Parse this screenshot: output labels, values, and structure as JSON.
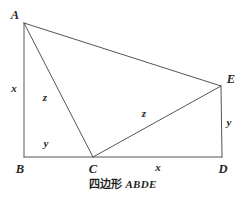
{
  "figure": {
    "caption_cn": "四边形",
    "caption_en": "ABDE",
    "stroke_color": "#555555",
    "text_color": "#262626",
    "background_color": "#ffffff",
    "vertices": [
      {
        "name": "A",
        "label": "A",
        "x": 24,
        "y": 23,
        "label_x": 15,
        "label_y": 15
      },
      {
        "name": "B",
        "label": "B",
        "x": 24,
        "y": 157,
        "label_x": 20,
        "label_y": 169
      },
      {
        "name": "C",
        "label": "C",
        "x": 93,
        "y": 157,
        "label_x": 93,
        "label_y": 169
      },
      {
        "name": "D",
        "label": "D",
        "x": 222,
        "y": 157,
        "label_x": 223,
        "label_y": 169
      },
      {
        "name": "E",
        "label": "E",
        "x": 221,
        "y": 86,
        "label_x": 231,
        "label_y": 79
      }
    ],
    "edges": [
      {
        "name": "segment-A-B",
        "from": "A",
        "to": "B"
      },
      {
        "name": "segment-B-D",
        "from": "B",
        "to": "D"
      },
      {
        "name": "segment-D-E",
        "from": "D",
        "to": "E"
      },
      {
        "name": "segment-E-A",
        "from": "E",
        "to": "A"
      },
      {
        "name": "segment-A-C",
        "from": "A",
        "to": "C"
      },
      {
        "name": "segment-C-E",
        "from": "C",
        "to": "E"
      }
    ],
    "side_labels": [
      {
        "name": "length-label-AB",
        "text": "x",
        "x": 14,
        "y": 88
      },
      {
        "name": "length-label-AC",
        "text": "z",
        "x": 45,
        "y": 97
      },
      {
        "name": "length-label-BC",
        "text": "y",
        "x": 46,
        "y": 143
      },
      {
        "name": "length-label-CE",
        "text": "z",
        "x": 144,
        "y": 113
      },
      {
        "name": "length-label-CD",
        "text": "x",
        "x": 158,
        "y": 167
      },
      {
        "name": "length-label-DE",
        "text": "y",
        "x": 229,
        "y": 122
      }
    ]
  }
}
